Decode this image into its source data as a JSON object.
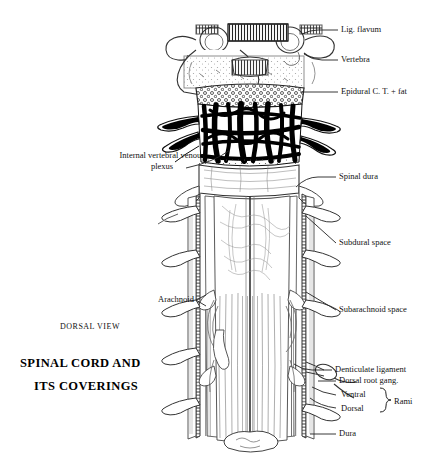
{
  "figure": {
    "view_label": "DORSAL VIEW",
    "title_line1": "SPINAL CORD AND",
    "title_line2": "ITS COVERINGS",
    "ink": "#111111",
    "background": "#ffffff"
  },
  "labels": {
    "lig_flavum": "Lig. flavum",
    "vertebra": "Vertebra",
    "epidural": "Epidural C. T. + fat",
    "venous_plexus_line1": "Internal vertebral venous",
    "venous_plexus_line2": "plexus",
    "spinal_dura": "Spinal dura",
    "subdural_space": "Subdural space",
    "subarachnoid_space": "Subarachnoid space",
    "arachnoid": "Arachnoid",
    "denticulate_ligament": "Denticulate ligament",
    "dorsal_root_gang": "Dorsal root gang.",
    "ventral": "Ventral",
    "dorsal": "Dorsal",
    "rami": "Rami",
    "dura": "Dura"
  }
}
